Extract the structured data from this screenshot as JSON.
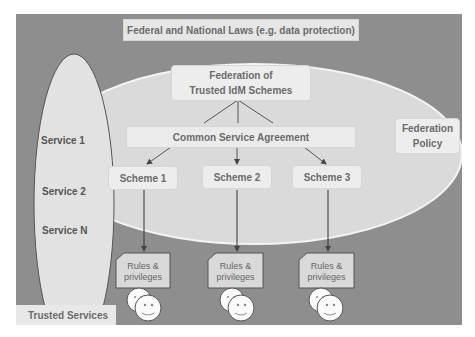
{
  "laws": {
    "label": "Federal and National Laws (e.g. data protection)"
  },
  "federation": {
    "title_line1": "Federation of",
    "title_line2": "Trusted IdM Schemes"
  },
  "agreement": {
    "label": "Common Service Agreement"
  },
  "policy": {
    "line1": "Federation",
    "line2": "Policy"
  },
  "schemes": [
    {
      "label": "Scheme 1"
    },
    {
      "label": "Scheme 2"
    },
    {
      "label": "Scheme 3"
    }
  ],
  "rules": [
    {
      "line1": "Rules &",
      "line2": "privileges"
    },
    {
      "line1": "Rules &",
      "line2": "privileges"
    },
    {
      "line1": "Rules &",
      "line2": "privileges"
    }
  ],
  "services": [
    {
      "label": "Service 1"
    },
    {
      "label": "Service 2"
    },
    {
      "label": "Service N"
    }
  ],
  "trusted_services": {
    "label": "Trusted Services"
  },
  "icons": {
    "users": "smiley-face-icon"
  },
  "colors": {
    "background": "#8e8e8e",
    "ellipse": "#dcdcdc",
    "box": "#ededed",
    "text": "#6b6b6b"
  }
}
